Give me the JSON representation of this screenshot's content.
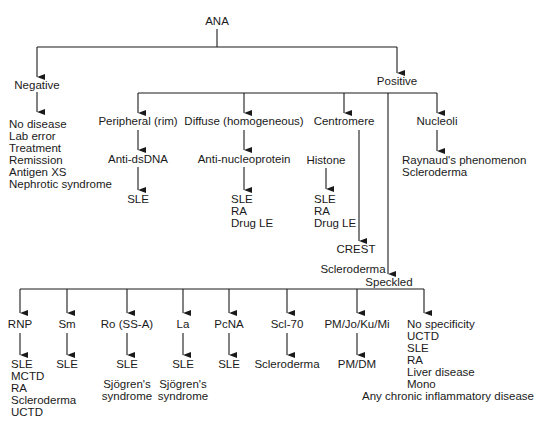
{
  "diagram": {
    "root": "ANA",
    "negative": {
      "label": "Negative",
      "outcomes": [
        "No disease",
        "Lab error",
        "Treatment",
        "Remission",
        "Antigen XS",
        "Nephrotic syndrome"
      ]
    },
    "positive": {
      "label": "Positive",
      "patterns": {
        "peripheral": {
          "label": "Peripheral (rim)",
          "antibody": "Anti-dsDNA",
          "diseases": [
            "SLE"
          ]
        },
        "diffuse": {
          "label": "Diffuse (homogeneous)",
          "antibody": "Anti-nucleoprotein",
          "diseases": [
            "SLE",
            "RA",
            "Drug LE"
          ]
        },
        "centromere": {
          "label": "Centromere",
          "histone": "Histone",
          "histone_diseases": [
            "SLE",
            "RA",
            "Drug LE"
          ],
          "target": "CREST",
          "target_disease": "Scleroderma"
        },
        "nucleoli": {
          "label": "Nucleoli",
          "diseases": [
            "Raynaud's phenomenon",
            "Scleroderma"
          ]
        },
        "speckled": {
          "label": "Speckled",
          "antigens": [
            {
              "label": "RNP",
              "diseases": [
                "SLE",
                "MCTD",
                "RA",
                "Scleroderma",
                "UCTD"
              ]
            },
            {
              "label": "Sm",
              "diseases": [
                "SLE"
              ]
            },
            {
              "label": "Ro (SS-A)",
              "diseases": [
                "SLE"
              ],
              "extra": [
                "Sjögren's",
                "syndrome"
              ]
            },
            {
              "label": "La",
              "diseases": [
                "SLE"
              ],
              "extra": [
                "Sjögren's",
                "syndrome"
              ]
            },
            {
              "label": "PcNA",
              "diseases": [
                "SLE"
              ]
            },
            {
              "label": "Scl-70",
              "diseases": [
                "Scleroderma"
              ]
            },
            {
              "label": "PM/Jo/Ku/Mi",
              "diseases": [
                "PM/DM"
              ]
            },
            {
              "label": "No specificity",
              "diseases": [
                "UCTD",
                "SLE",
                "RA",
                "Liver disease",
                "Mono"
              ],
              "extra_wide": "Any chronic inflammatory disease"
            }
          ]
        }
      }
    }
  },
  "colors": {
    "line": "#1a1a1a",
    "background": "#ffffff"
  }
}
